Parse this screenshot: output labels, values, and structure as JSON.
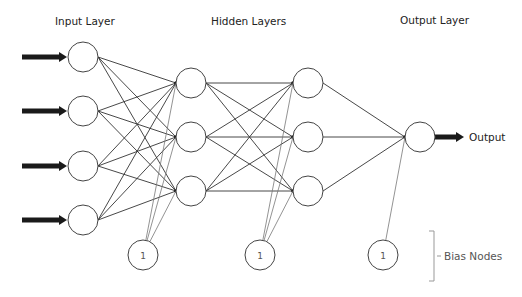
{
  "layers": {
    "input_label": "Input Layer",
    "hidden_label": "Hidden Layers",
    "output_label": "Output Layer"
  },
  "network": {
    "input_nodes": 4,
    "hidden_layers": [
      3,
      3
    ],
    "output_nodes": 1,
    "bias_nodes": 3
  },
  "bias": {
    "node_label": "1",
    "group_label": "Bias Nodes"
  },
  "output": {
    "label": "Output"
  },
  "colors": {
    "line": "#333333",
    "arrow": "#1a1a1a",
    "bias_line": "#777777",
    "node_stroke": "#444444"
  }
}
